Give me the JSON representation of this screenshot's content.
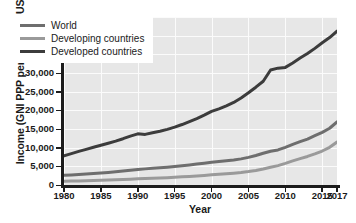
{
  "chart_data": {
    "type": "line",
    "title": "",
    "xlabel": "Year",
    "ylabel": "Income (GNI PPP per capita in US $)",
    "xlim": [
      1980,
      2017
    ],
    "ylim": [
      0,
      45000
    ],
    "grid": true,
    "legend_position": "upper-left-inside",
    "x_ticks": [
      "1980",
      "1985",
      "1990",
      "1995",
      "2000",
      "2005",
      "2010",
      "2015",
      "2017"
    ],
    "x_tick_values": [
      1980,
      1985,
      1990,
      1995,
      2000,
      2005,
      2010,
      2015,
      2017
    ],
    "y_ticks": [
      "0",
      "5,000",
      "10,000",
      "15,000",
      "20,000",
      "25,000",
      "30,000",
      "35,000",
      "40,000",
      "45,000"
    ],
    "y_tick_values": [
      0,
      5000,
      10000,
      15000,
      20000,
      25000,
      30000,
      35000,
      40000,
      45000
    ],
    "x": [
      1980,
      1981,
      1982,
      1983,
      1984,
      1985,
      1986,
      1987,
      1988,
      1989,
      1990,
      1991,
      1992,
      1993,
      1994,
      1995,
      1996,
      1997,
      1998,
      1999,
      2000,
      2001,
      2002,
      2003,
      2004,
      2005,
      2006,
      2007,
      2008,
      2009,
      2010,
      2011,
      2012,
      2013,
      2014,
      2015,
      2016,
      2017
    ],
    "series": [
      {
        "name": "World",
        "color": "#6e6e6e",
        "values": [
          2600,
          2700,
          2820,
          2950,
          3080,
          3220,
          3360,
          3520,
          3720,
          3930,
          4150,
          4320,
          4480,
          4620,
          4780,
          4950,
          5150,
          5380,
          5600,
          5830,
          6100,
          6300,
          6500,
          6720,
          7000,
          7400,
          7900,
          8500,
          9050,
          9400,
          10100,
          10900,
          11600,
          12300,
          13200,
          14100,
          15200,
          16900
        ]
      },
      {
        "name": "Developing countries",
        "color": "#9a9a9a",
        "values": [
          1000,
          1040,
          1080,
          1130,
          1190,
          1250,
          1310,
          1380,
          1460,
          1550,
          1650,
          1720,
          1800,
          1880,
          1970,
          2070,
          2180,
          2300,
          2420,
          2550,
          2720,
          2850,
          2990,
          3150,
          3350,
          3600,
          3900,
          4300,
          4750,
          5200,
          5800,
          6450,
          7050,
          7650,
          8350,
          9100,
          10100,
          11500
        ]
      },
      {
        "name": "Developed countries",
        "color": "#3c3c3c",
        "values": [
          7800,
          8400,
          9000,
          9550,
          10100,
          10650,
          11200,
          11750,
          12400,
          13100,
          13700,
          13550,
          14000,
          14400,
          14900,
          15500,
          16200,
          17000,
          17800,
          18700,
          19700,
          20400,
          21200,
          22100,
          23300,
          24700,
          26200,
          27800,
          30800,
          31300,
          31500,
          32700,
          34000,
          35200,
          36600,
          38100,
          39500,
          41200
        ]
      }
    ]
  },
  "legend": {
    "entries": [
      {
        "label": "World",
        "color": "#6e6e6e"
      },
      {
        "label": "Developing countries",
        "color": "#9a9a9a"
      },
      {
        "label": "Developed countries",
        "color": "#3c3c3c"
      }
    ]
  },
  "axes": {
    "y_title": "Income (GNI PPP per capita in US $)",
    "x_title": "Year"
  },
  "colors": {
    "plot_background": "#e7e7e7",
    "gridline": "#fbfbfb",
    "axis": "#1c1c1c",
    "text": "#1a1a1a",
    "page_background": "#ffffff"
  }
}
